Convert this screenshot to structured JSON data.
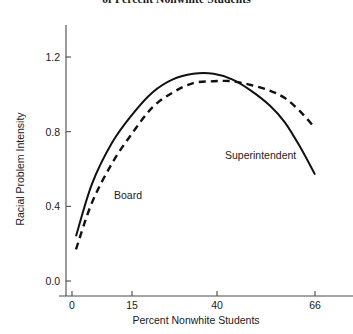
{
  "chart_data": {
    "type": "line",
    "title": "of Percent Nonwhite Students",
    "xlabel": "Percent Nonwhite Students",
    "ylabel": "Racial Problem Intensity",
    "grid": false,
    "legend_position": "inline-annotations",
    "xticks": [
      0,
      15,
      40,
      66
    ],
    "xtick_labels": [
      "0",
      "15",
      "40",
      "66"
    ],
    "yticks": [
      0.0,
      0.4,
      0.8,
      1.2
    ],
    "ytick_labels": [
      "0.0",
      "0.4",
      "0.8",
      "1.2"
    ],
    "xlim": [
      0,
      66
    ],
    "ylim": [
      0.0,
      1.3
    ],
    "axis_note": "x tick values are unevenly spaced numerically but evenly spaced along the axis",
    "series": [
      {
        "name": "Board",
        "style": "solid",
        "color": "#111111",
        "x": [
          1,
          5,
          10,
          15,
          21,
          27,
          33,
          39,
          44,
          49,
          54,
          58,
          62,
          66
        ],
        "values": [
          0.24,
          0.52,
          0.74,
          0.89,
          1.01,
          1.08,
          1.11,
          1.11,
          1.08,
          1.02,
          0.94,
          0.85,
          0.72,
          0.57
        ]
      },
      {
        "name": "Superintendent",
        "style": "dashed",
        "color": "#111111",
        "x": [
          1,
          5,
          10,
          15,
          21,
          27,
          33,
          39,
          44,
          49,
          54,
          58,
          62,
          66
        ],
        "values": [
          0.17,
          0.42,
          0.63,
          0.79,
          0.93,
          1.01,
          1.06,
          1.07,
          1.07,
          1.05,
          1.02,
          0.98,
          0.91,
          0.82
        ]
      }
    ],
    "annotations": [
      {
        "text": "Board",
        "x": 13,
        "y": 0.55
      },
      {
        "text": "Superintendent",
        "x": 42,
        "y": 0.76
      }
    ]
  }
}
